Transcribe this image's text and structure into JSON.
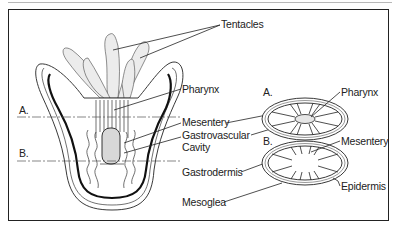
{
  "figure": {
    "labels": {
      "tentacles": "Tentacles",
      "pharynx_left": "Pharynx",
      "mesentery_left": "Mesentery",
      "gastrovascular_line1": "Gastrovascular",
      "gastrovascular_line2": "Cavity",
      "gastrodermis": "Gastrodermis",
      "mesoglea": "Mesoglea",
      "section_a_left": "A.",
      "section_b_left": "B.",
      "section_a_right": "A.",
      "section_b_right": "B.",
      "pharynx_right": "Pharynx",
      "mesentery_right": "Mesentery",
      "epidermis": "Epidermis"
    },
    "colors": {
      "ink": "#222222",
      "frame": "#222222",
      "topline": "#b8b8b8",
      "stipple": "#ececec"
    }
  }
}
